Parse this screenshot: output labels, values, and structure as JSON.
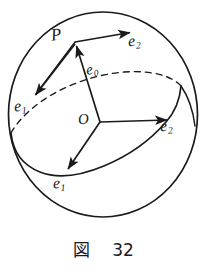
{
  "figure": {
    "caption_label": "図",
    "caption_number": "32",
    "stroke_color": "#1a1a1a",
    "background_color": "#ffffff",
    "sphere": {
      "name": "sphere-outline",
      "center_x": 103,
      "center_y": 114,
      "radius_x": 95,
      "radius_y": 103
    },
    "labels": {
      "point_p": "P",
      "e0": "e",
      "e0_sub": "0",
      "e1_left": "e",
      "e1_left_sub": "1",
      "e1_bottom": "e",
      "e1_bottom_sub": "1",
      "e2_top": "e",
      "e2_top_sub": "2",
      "e2_right": "e",
      "e2_right_sub": "2",
      "origin": "O"
    },
    "vectors": [
      {
        "name": "e0-vector",
        "from": [
          100,
          122
        ],
        "to": [
          75,
          42
        ],
        "label": "e0"
      },
      {
        "name": "e2-top-vector",
        "from": [
          75,
          42
        ],
        "to": [
          133,
          32
        ],
        "label": "e2"
      },
      {
        "name": "e1-left-vector",
        "from": [
          75,
          42
        ],
        "to": [
          34,
          96
        ],
        "label": "e1"
      },
      {
        "name": "e2-right-vector",
        "from": [
          100,
          122
        ],
        "to": [
          170,
          120
        ],
        "label": "e2"
      },
      {
        "name": "e1-bottom-vector",
        "from": [
          100,
          122
        ],
        "to": [
          66,
          172
        ],
        "label": "e1"
      }
    ],
    "curves": {
      "equator_front": "solid arc across lower sphere",
      "equator_back": "dashed arc across upper sphere",
      "great_circle_right": "solid arc near right limb"
    }
  }
}
